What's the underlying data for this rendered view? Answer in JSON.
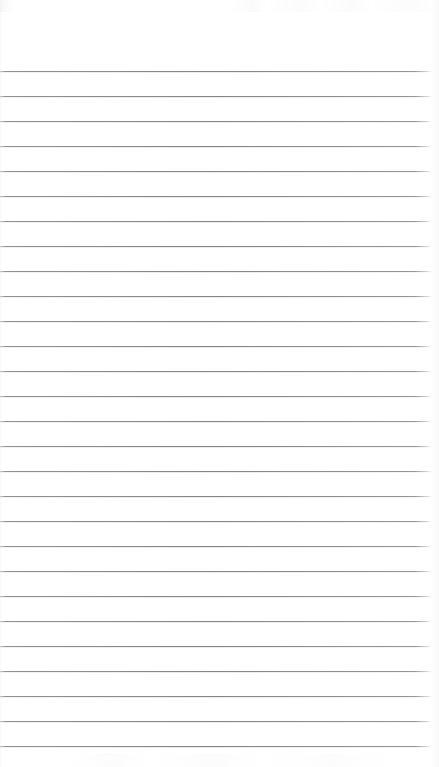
{
  "document": {
    "type": "ruled-notebook-page-scan",
    "title": "Blank Ruled Page",
    "content_text": "",
    "has_handwriting": false,
    "has_printed_text": false,
    "has_margin_rule": false,
    "page_number_text": ""
  },
  "page": {
    "width": 439,
    "height": 767,
    "background_color": "#ffffff",
    "orientation": "portrait"
  },
  "ruling": {
    "line_color": "#84848b",
    "line_thickness_px": 1,
    "line_spacing_px": 25,
    "first_line_y": 71,
    "line_start_x": 0,
    "line_end_x": 432,
    "line_count": 27,
    "line_y_positions": [
      71,
      96,
      121,
      146,
      171,
      196,
      221,
      246,
      271,
      296,
      321,
      346,
      371,
      396,
      421,
      446,
      471,
      496,
      521,
      546,
      571,
      596,
      621,
      646,
      671,
      696,
      721,
      746
    ]
  },
  "scan_artifacts": {
    "top_edge_noise_color": "#bfbfc4",
    "bottom_edge_noise_color": "#c3c3c8",
    "left_edge_shade_color": "#c8c8cd",
    "right_edge_shade_color": "#cdcdd2",
    "right_edge_fade": true
  }
}
